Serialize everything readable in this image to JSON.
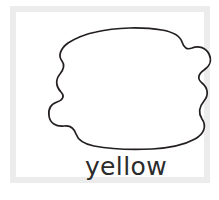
{
  "card": {
    "name": "color-word-coloring-card",
    "background_color": "#ffffff",
    "frame_color": "#ececec",
    "frame_width_px": 6
  },
  "figure": {
    "name": "blob-outline",
    "fill_color": "#ffffff",
    "stroke_color": "#231f20",
    "stroke_width_px": 1.7,
    "path": "M 64 8 C 84 3 112 3 130 6 C 142 8 148 12 150 18 C 152 24 155 26 160 24 C 167 21 174 24 177 30 C 180 36 178 42 172 46 C 166 50 165 55 170 59 C 176 64 177 71 172 77 C 167 83 166 89 170 95 C 175 102 172 110 163 115 C 152 121 138 124 120 125 C 100 126 78 125 62 122 C 52 120 46 116 44 110 C 42 104 38 101 32 102 C 24 103 18 99 17 92 C 16 85 19 80 25 78 C 31 76 33 72 29 68 C 24 63 23 56 28 50 C 32 45 33 41 30 37 C 26 32 28 25 36 19 C 44 14 54 10 64 8 Z"
  },
  "label": {
    "name": "color-word-label",
    "text": "yellow",
    "text_color": "#2b2b2b",
    "font_size_px": 25
  }
}
